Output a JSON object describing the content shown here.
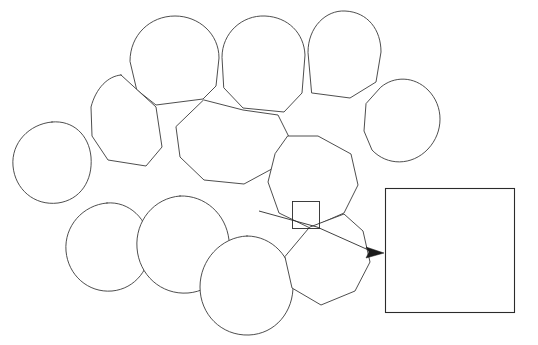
{
  "figure": {
    "background_color": "#ffffff",
    "line_color": "#3a3a3a",
    "width": 538,
    "height": 345
  },
  "grain_aggregate": {
    "label": "grain-aggregate",
    "description": "Cluster of rounded polygonal grains in contact",
    "grain_count": 12,
    "grains": [
      {
        "id": "grain-1",
        "label": "grain",
        "cx": 172,
        "cy": 63,
        "r": 47
      },
      {
        "id": "grain-2",
        "label": "grain",
        "cx": 262,
        "cy": 65,
        "r": 46
      },
      {
        "id": "grain-3",
        "label": "grain",
        "cx": 337,
        "cy": 50,
        "r": 44
      },
      {
        "id": "grain-4",
        "label": "grain",
        "cx": 356,
        "cy": 125,
        "r": 47
      },
      {
        "id": "grain-5",
        "label": "grain",
        "cx": 120,
        "cy": 115,
        "r": 44
      },
      {
        "id": "grain-6",
        "label": "grain",
        "cx": 222,
        "cy": 138,
        "r": 51
      },
      {
        "id": "grain-7",
        "label": "grain",
        "cx": 55,
        "cy": 170,
        "r": 46
      },
      {
        "id": "grain-8",
        "label": "grain",
        "cx": 305,
        "cy": 180,
        "r": 48
      },
      {
        "id": "grain-9",
        "label": "grain",
        "cx": 110,
        "cy": 248,
        "r": 45
      },
      {
        "id": "grain-10",
        "label": "grain",
        "cx": 182,
        "cy": 245,
        "r": 48
      },
      {
        "id": "grain-11",
        "label": "grain",
        "cx": 246,
        "cy": 283,
        "r": 47
      },
      {
        "id": "grain-12",
        "label": "grain",
        "cx": 325,
        "cy": 265,
        "r": 47
      }
    ]
  },
  "callout": {
    "label": "magnified-region-marker",
    "shape": "square",
    "x": 292,
    "y": 201,
    "size": 27,
    "leader": {
      "label": "leader-line",
      "from_x": 262,
      "from_y": 212,
      "to_x": 372,
      "to_y": 252,
      "arrow_direction": "right",
      "arrow_target": "inset-panel"
    }
  },
  "inset": {
    "label": "grain-boundary-detail",
    "x": 385,
    "y": 188,
    "width": 130,
    "height": 125,
    "hatch": {
      "label": "cross-section-hatching",
      "direction": "backslash",
      "angle_deg": 45,
      "spacing_px": 2.6,
      "color": "#4a4a4a"
    },
    "boundary": {
      "label": "grain-boundary",
      "style": "wavy-band",
      "band_color": "#ffffff",
      "line_color": "#262626"
    }
  }
}
